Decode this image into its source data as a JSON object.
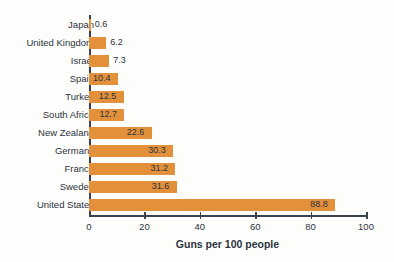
{
  "chart_data": {
    "type": "bar",
    "orientation": "horizontal",
    "title": "",
    "xlabel": "Guns per 100 people",
    "ylabel": "",
    "xlim": [
      0,
      100
    ],
    "xticks": [
      0,
      20,
      40,
      60,
      80,
      100
    ],
    "grid": false,
    "legend": null,
    "bar_color": "#e2913a",
    "text_color": "#2b3340",
    "background_color": "#fdfdfb",
    "categories": [
      "Japan",
      "United Kingdom",
      "Israel",
      "Spain",
      "Turkey",
      "South Africa",
      "New Zealand",
      "Germany",
      "France",
      "Sweden",
      "United States"
    ],
    "values": [
      0.6,
      6.2,
      7.3,
      10.4,
      12.5,
      12.7,
      22.6,
      30.3,
      31.2,
      31.6,
      88.8
    ],
    "value_labels": [
      "0.6",
      "6.2",
      "7.3",
      "10.4",
      "12.5",
      "12.7",
      "22.6",
      "30.3",
      "31.2",
      "31.6",
      "88.8"
    ],
    "xtick_labels": [
      "0",
      "20",
      "40",
      "60",
      "80",
      "100"
    ]
  }
}
